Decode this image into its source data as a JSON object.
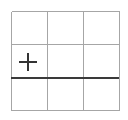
{
  "canvas": {
    "width": 128,
    "height": 120,
    "background_color": "#ffffff"
  },
  "figure": {
    "title": ""
  },
  "grid": {
    "name": "3x3-grid",
    "rows": 3,
    "columns": 3,
    "line_color": "#a6a6a6",
    "line_width": 1,
    "bounds": {
      "left": 11,
      "top": 11,
      "right": 119,
      "bottom": 110
    },
    "vertical_line_x": [
      11,
      47,
      83,
      119
    ],
    "horizontal_line_y": [
      11,
      44,
      77,
      110
    ],
    "cells": [
      {
        "row": 0,
        "col": 0,
        "content": ""
      },
      {
        "row": 0,
        "col": 1,
        "content": ""
      },
      {
        "row": 0,
        "col": 2,
        "content": ""
      },
      {
        "row": 1,
        "col": 0,
        "content": "plus-marker"
      },
      {
        "row": 1,
        "col": 1,
        "content": ""
      },
      {
        "row": 1,
        "col": 2,
        "content": ""
      },
      {
        "row": 2,
        "col": 0,
        "content": ""
      },
      {
        "row": 2,
        "col": 1,
        "content": ""
      },
      {
        "row": 2,
        "col": 2,
        "content": ""
      }
    ]
  },
  "emphasis_rule": {
    "name": "dark-horizontal-rule",
    "color": "#3a3a3a",
    "line_width": 2,
    "y": 77,
    "x_start": 11,
    "x_end": 119
  },
  "plus_marker": {
    "name": "plus-marker",
    "color": "#333333",
    "stroke_width": 2,
    "center_x": 28,
    "center_y": 62,
    "arm_length": 9,
    "label": "+"
  }
}
